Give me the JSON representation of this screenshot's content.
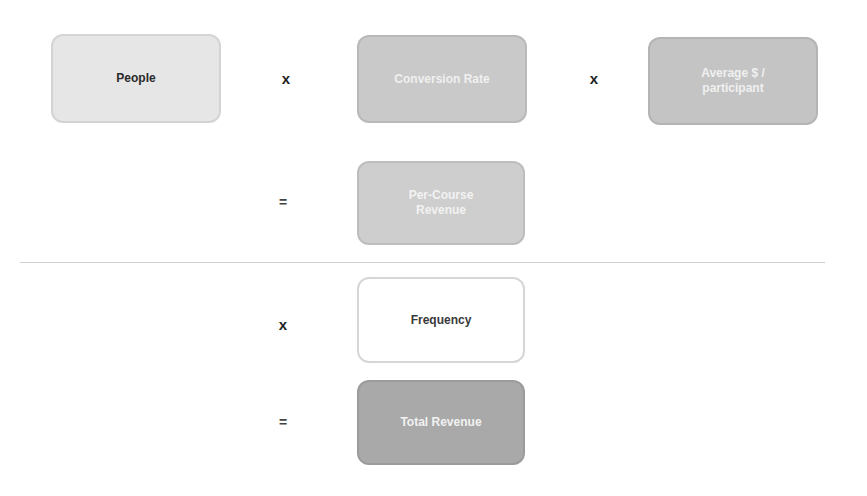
{
  "diagram": {
    "row1": {
      "people": {
        "label": "People",
        "bg": "#e6e6e6",
        "fg": "#2a2a2a"
      },
      "op1": "x",
      "conversion": {
        "label": "Conversion Rate",
        "bg": "#c9c9c9",
        "fg": "#f0f0f0"
      },
      "op2": "x",
      "average": {
        "label": "Average $ / participant",
        "bg": "#c4c4c4",
        "fg": "#f0f0f0"
      }
    },
    "row2": {
      "op": "=",
      "per_course": {
        "label": "Per-Course Revenue",
        "bg": "#cecece",
        "fg": "#f2f2f2"
      }
    },
    "row3": {
      "op": "x",
      "frequency": {
        "label": "Frequency",
        "bg": "#ffffff",
        "fg": "#3a3a3a"
      }
    },
    "row4": {
      "op": "=",
      "total": {
        "label": "Total Revenue",
        "bg": "#a9a9a9",
        "fg": "#f2f2f2"
      }
    }
  }
}
